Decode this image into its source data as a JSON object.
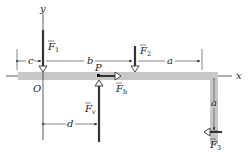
{
  "diagram": {
    "type": "beam-free-body",
    "axes": {
      "x_label": "x",
      "y_label": "y",
      "origin_label": "O"
    },
    "point_label": "P",
    "forces": [
      {
        "id": "F1",
        "label": "F",
        "subscript": "1",
        "direction": "down"
      },
      {
        "id": "F2",
        "label": "F",
        "subscript": "2",
        "direction": "down"
      },
      {
        "id": "F3",
        "label": "F",
        "subscript": "3",
        "direction": "left"
      },
      {
        "id": "Fh",
        "label": "F",
        "subscript": "h",
        "direction": "right"
      },
      {
        "id": "Fv",
        "label": "F",
        "subscript": "v",
        "direction": "up"
      }
    ],
    "dimensions": [
      {
        "label": "c"
      },
      {
        "label": "b"
      },
      {
        "label": "a",
        "position": "horizontal"
      },
      {
        "label": "a",
        "position": "vertical"
      },
      {
        "label": "d"
      }
    ],
    "colors": {
      "beam": "#c8c8c8",
      "line": "#333333",
      "background": "#ffffff"
    }
  }
}
